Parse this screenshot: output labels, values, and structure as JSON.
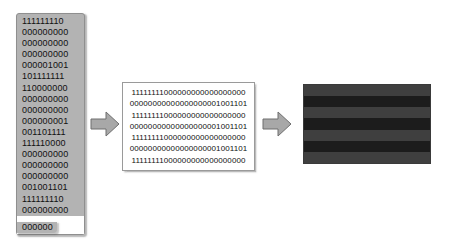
{
  "diagram": {
    "background_color": "#ffffff"
  },
  "bitstream_column": {
    "name": "raw bit stream",
    "fill_color": "#b3b3b3",
    "border_color": "#8f8f8f",
    "bits_per_row": 9,
    "rows": [
      "111111110",
      "000000000",
      "000000000",
      "000000000",
      "000001001",
      "101111111",
      "110000000",
      "000000000",
      "000000000",
      "000000001",
      "001101111",
      "111110000",
      "000000000",
      "000000000",
      "000000000",
      "001001101",
      "111111110",
      "000000000"
    ],
    "truncated_row": "000000"
  },
  "arrows": [
    {
      "name": "arrow-1",
      "label": "",
      "direction": "right",
      "fill_color": "#a8a8a8",
      "stroke_color": "#6f6f6f"
    },
    {
      "name": "arrow-2",
      "label": "",
      "direction": "right",
      "fill_color": "#a8a8a8",
      "stroke_color": "#6f6f6f"
    }
  ],
  "bit_matrix": {
    "name": "row aligned bit matrix",
    "fill_color": "#ffffff",
    "border_color": "#9a9a9a",
    "bits_per_row": 26,
    "rows": [
      "11111111000000000000000000",
      "00000000000000000001001101",
      "11111111000000000000000000",
      "00000000000000000001001101",
      "11111111000000000000000000",
      "00000000000000000001001101",
      "11111111000000000000000000"
    ]
  },
  "rendered_image": {
    "name": "resulting striped bitmap",
    "border_color": "#3a3a3a",
    "band_count": 7,
    "bands": [
      {
        "index": 0,
        "color": "#3f3f3f",
        "value": "light"
      },
      {
        "index": 1,
        "color": "#1c1c1c",
        "value": "dark"
      },
      {
        "index": 2,
        "color": "#3f3f3f",
        "value": "light"
      },
      {
        "index": 3,
        "color": "#1c1c1c",
        "value": "dark"
      },
      {
        "index": 4,
        "color": "#3f3f3f",
        "value": "light"
      },
      {
        "index": 5,
        "color": "#1c1c1c",
        "value": "dark"
      },
      {
        "index": 6,
        "color": "#3f3f3f",
        "value": "light"
      }
    ]
  }
}
